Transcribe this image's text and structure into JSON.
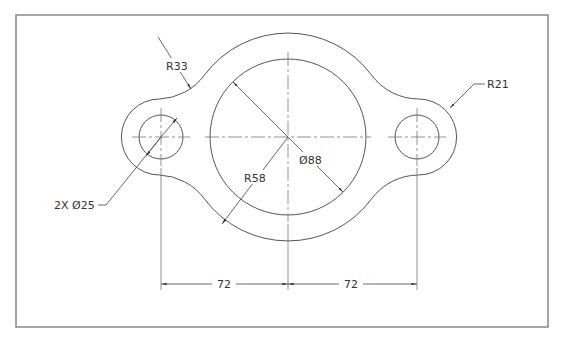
{
  "drawing": {
    "type": "engineering-drawing",
    "part": "flange plate with two bolt holes",
    "line_color": "#555555",
    "border_color": "#888888",
    "dimensions": {
      "fillet_radius": "R33",
      "lobe_radius": "R21",
      "outer_radius": "R58",
      "bore_diameter": "Ø88",
      "hole_callout": "2X Ø25",
      "spacing_left": "72",
      "spacing_right": "72"
    }
  }
}
